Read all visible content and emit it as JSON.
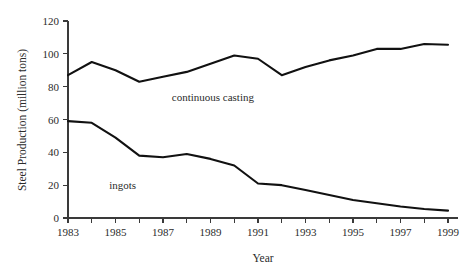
{
  "chart_data": {
    "type": "line",
    "title": "",
    "xlabel": "Year",
    "ylabel": "Steel Production (million tons)",
    "x": [
      1983,
      1984,
      1985,
      1986,
      1987,
      1988,
      1989,
      1990,
      1991,
      1992,
      1993,
      1994,
      1995,
      1996,
      1997,
      1998,
      1999
    ],
    "xlim": [
      1983,
      1999
    ],
    "ylim": [
      0,
      120
    ],
    "xticks": [
      1983,
      1984,
      1985,
      1986,
      1987,
      1988,
      1989,
      1990,
      1991,
      1992,
      1993,
      1994,
      1995,
      1996,
      1997,
      1998,
      1999
    ],
    "xtick_labels": [
      "1983",
      "",
      "1985",
      "",
      "1987",
      "",
      "1989",
      "",
      "1991",
      "",
      "1993",
      "",
      "1995",
      "",
      "1997",
      "",
      "1999"
    ],
    "yticks": [
      0,
      20,
      40,
      60,
      80,
      100,
      120
    ],
    "ytick_labels": [
      "0",
      "20",
      "40",
      "60",
      "80",
      "100",
      "120"
    ],
    "grid": false,
    "legend": "inline-annotations",
    "series": [
      {
        "name": "continuous casting",
        "label_text": "continuous casting",
        "values": [
          87,
          95,
          90,
          83,
          86,
          89,
          94,
          99,
          97,
          87,
          92,
          96,
          99,
          103,
          103,
          106,
          105.5
        ]
      },
      {
        "name": "ingots",
        "label_text": "ingots",
        "values": [
          59,
          58,
          49,
          38,
          37,
          39,
          36,
          32,
          21,
          20,
          17,
          14,
          11,
          9,
          7,
          5.5,
          4.5
        ]
      }
    ],
    "annotations": [
      {
        "text": "continuous casting",
        "x": 1989.1,
        "y": 71,
        "name": "continuous-casting-label"
      },
      {
        "text": "ingots",
        "x": 1985.3,
        "y": 17.5,
        "name": "ingots-label"
      }
    ],
    "colors": {
      "line": "#111111",
      "axis": "#3a3a3a",
      "text": "#2b2b2b",
      "background": "#ffffff"
    }
  }
}
